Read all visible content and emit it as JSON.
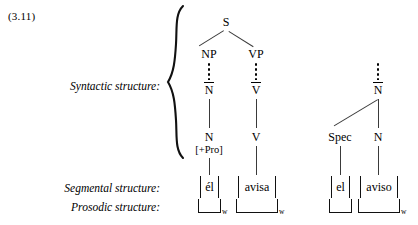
{
  "example": {
    "number": "(3.11)"
  },
  "rows": {
    "syntactic_label": "Syntactic structure:",
    "segmental_label": "Segmental structure:",
    "prosodic_label": "Prosodic structure:"
  },
  "trees": [
    {
      "name": "sentence-tree",
      "nodes": {
        "s": "S",
        "np": "NP",
        "vp": "VP",
        "nbar": "N",
        "vbar": "V",
        "n": "N",
        "n_features": "[+Pro]",
        "v": "V"
      }
    },
    {
      "name": "noun-phrase-tree",
      "nodes": {
        "nbar": "N",
        "spec": "Spec",
        "n": "N"
      }
    }
  ],
  "segmental": [
    {
      "name": "el-pronoun",
      "text": "él"
    },
    {
      "name": "avisa-verb",
      "text": "avisa"
    },
    {
      "name": "el-determiner",
      "text": "el"
    },
    {
      "name": "aviso-noun",
      "text": "aviso"
    }
  ],
  "prosodic": [
    {
      "name": "word-el-pronoun",
      "subscript": "w"
    },
    {
      "name": "word-avisa",
      "subscript": "w"
    },
    {
      "name": "word-el-determiner",
      "subscript": ""
    },
    {
      "name": "word-aviso",
      "subscript": "w"
    }
  ],
  "colors": {
    "text": "#000000",
    "line": "#3a3a3a",
    "background": "#ffffff"
  }
}
